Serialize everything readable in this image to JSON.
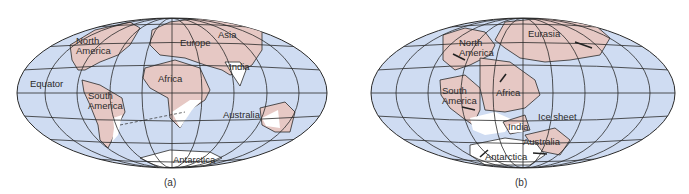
{
  "colors": {
    "ocean": "#cfdcf2",
    "land": "#e6c8c4",
    "ice": "#ffffff",
    "grid": "#2a2a2a"
  },
  "panel_a": {
    "caption": "(a)",
    "labels": {
      "north_america": "North\nAmerica",
      "europe": "Europe",
      "asia": "Asia",
      "india": "India",
      "equator": "Equator",
      "africa": "Africa",
      "south_america": "South\nAmerica",
      "australia": "Australia",
      "antarctica": "Antarctica"
    }
  },
  "panel_b": {
    "caption": "(b)",
    "labels": {
      "eurasia": "Eurasia",
      "north_america": "North\nAmerica",
      "south_america": "South\nAmerica",
      "africa": "Africa",
      "ice_sheet": "Ice sheet",
      "india": "India",
      "australia": "Australia",
      "antarctica": "Antarctica"
    }
  }
}
